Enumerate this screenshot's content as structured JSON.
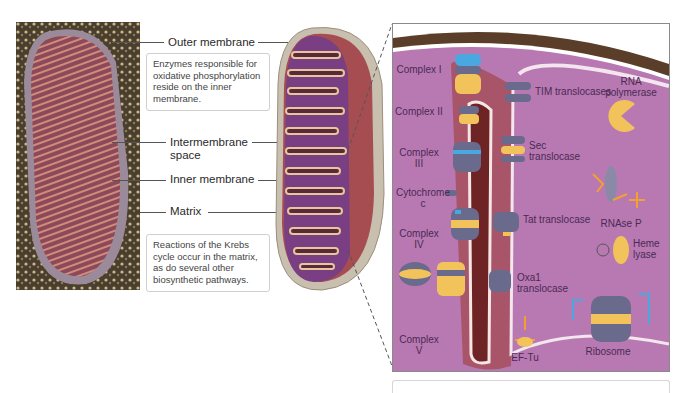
{
  "diagram": {
    "colors": {
      "matrix": "#b06fa8",
      "intermembrane": "#7a2a2a",
      "outer_membrane_band": "#5a3e2a",
      "protein_gray": "#6a6a8c",
      "protein_yellow": "#f2c35a",
      "protein_blue": "#4aa8e0",
      "text": "#4a2a52"
    },
    "micrograph": {
      "description": "electron micrograph of mitochondrion"
    },
    "left_labels": [
      {
        "id": "outer-membrane",
        "text": "Outer membrane"
      },
      {
        "id": "intermembrane-space",
        "text": "Intermembrane space"
      },
      {
        "id": "inner-membrane",
        "text": "Inner membrane"
      },
      {
        "id": "matrix",
        "text": "Matrix"
      }
    ],
    "notes": {
      "top": "Enzymes responsible for oxidative phosphorylation reside on the inner membrane.",
      "bottom": "Reactions of the Krebs cycle occur in the matrix, as do several other biosynthetic pathways."
    },
    "panel_labels": {
      "complex_i": "Complex I",
      "complex_ii": "Complex II",
      "complex_iii": "Complex III",
      "cytochrome_c": "Cytochrome c",
      "complex_iv": "Complex IV",
      "complex_v": "Complex V",
      "tim": "TIM translocases",
      "sec": "Sec translocase",
      "tat": "Tat translocase",
      "oxa1": "Oxa1 translocase",
      "rna_pol": "RNA polymerase",
      "rnase_p": "RNAse P",
      "heme_lyase": "Heme lyase",
      "ef_tu": "EF-Tu",
      "ribosome": "Ribosome"
    }
  }
}
